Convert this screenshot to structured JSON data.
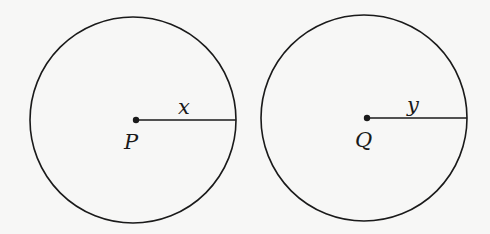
{
  "figures": [
    {
      "id": "circle-p",
      "center_label": "P",
      "radius_label": "x"
    },
    {
      "id": "circle-q",
      "center_label": "Q",
      "radius_label": "y"
    }
  ],
  "colors": {
    "stroke": "#1a1a1a",
    "background": "#f7f7f6"
  }
}
